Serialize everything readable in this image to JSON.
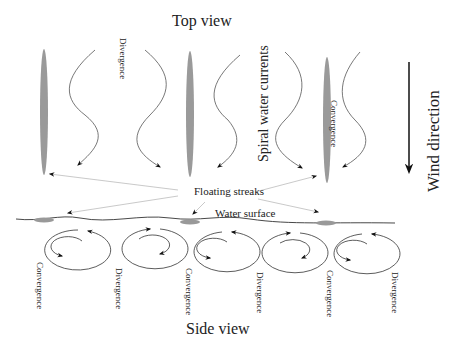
{
  "diagram": {
    "top_title": "Top view",
    "bottom_title": "Side view",
    "wind_label": "Wind direction",
    "spiral_label": "Spiral water currents",
    "streaks_label": "Floating streaks",
    "surface_label": "Water surface",
    "top_labels": {
      "divergence": "Divergence",
      "convergence": "Convergence"
    },
    "side_labels": [
      "Convergence",
      "Divergence",
      "Convergence",
      "Divergence",
      "Convergence",
      "Divergence"
    ],
    "colors": {
      "streak": "#9a9a9a",
      "line": "#333333",
      "pointer": "#bbbbbb"
    }
  }
}
